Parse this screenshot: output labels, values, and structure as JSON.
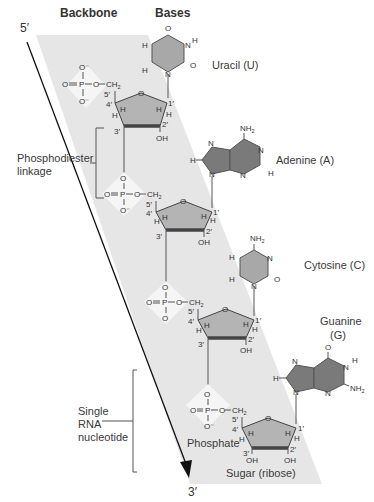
{
  "headers": {
    "backbone": "Backbone",
    "bases": "Bases"
  },
  "strand_ends": {
    "five_prime": "5′",
    "three_prime": "3′"
  },
  "labels": {
    "phosphodiester_1": "Phosphodiester",
    "phosphodiester_2": "linkage",
    "single_1": "Single",
    "single_2": "RNA",
    "single_3": "nucleotide",
    "phosphate": "Phosphate",
    "sugar": "Sugar (ribose)"
  },
  "bases": [
    {
      "name": "Uracil (U)",
      "type": "pyrimidine"
    },
    {
      "name": "Adenine (A)",
      "type": "purine"
    },
    {
      "name": "Cytosine (C)",
      "type": "pyrimidine"
    },
    {
      "name": "Guanine",
      "name2": "(G)",
      "type": "purine"
    }
  ],
  "atoms": {
    "O": "O",
    "Ominus": "O⁻",
    "P": "P",
    "CH2": "CH",
    "sub2": "2",
    "N": "N",
    "H": "H",
    "NH2": "NH",
    "OH": "OH"
  },
  "primes": {
    "p1": "1′",
    "p2": "2′",
    "p3": "3′",
    "p4": "4′",
    "p5": "5′"
  },
  "colors": {
    "band": "#e6e6e6",
    "pyrimidine_fill": "#a8a8a8",
    "purine_fill": "#7a7a7a",
    "sugar_fill": "#b4b4b4",
    "text": "#333333"
  }
}
